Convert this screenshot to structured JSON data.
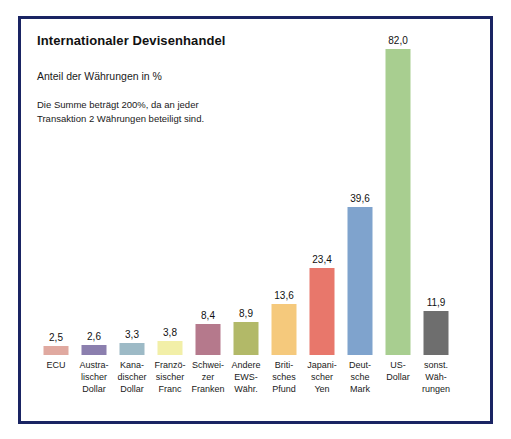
{
  "chart_data": {
    "type": "bar",
    "title": "Internationaler Devisenhandel",
    "subtitle": "Anteil der Währungen in %",
    "note": "Die Summe beträgt 200%, da an jeder\nTransaktion 2 Währungen beteiligt sind.",
    "xlabel": "",
    "ylabel": "",
    "ylim": [
      0,
      82
    ],
    "grid": false,
    "legend": "none",
    "value_labels": true,
    "decimal_separator": ",",
    "categories": [
      "ECU",
      "Austra-\nlischer\nDollar",
      "Kana-\ndischer\nDollar",
      "Franzö-\nsischer\nFranc",
      "Schwei-\nzer\nFranken",
      "Andere\nEWS-\nWähr.",
      "Briti-\nsches\nPfund",
      "Japani-\nscher\nYen",
      "Deut-\nsche\nMark",
      "US-\nDollar",
      "sonst.\nWäh-\nrungen"
    ],
    "values": [
      2.5,
      2.6,
      3.3,
      3.8,
      8.4,
      8.9,
      13.6,
      23.4,
      39.6,
      82.0,
      11.9
    ],
    "value_labels_text": [
      "2,5",
      "2,6",
      "3,3",
      "3,8",
      "8,4",
      "8,9",
      "13,6",
      "23,4",
      "39,6",
      "82,0",
      "11,9"
    ],
    "colors": [
      "#e0a9a0",
      "#8b7fae",
      "#9dbac6",
      "#f2efa8",
      "#b5798c",
      "#b2b968",
      "#f5c97c",
      "#e8776b",
      "#7fa3cd",
      "#a8ce90",
      "#6e6e6e"
    ],
    "border_color": "#1a2463",
    "background": "#ffffff"
  }
}
